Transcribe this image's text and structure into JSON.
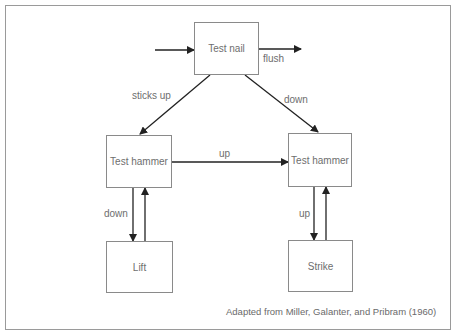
{
  "diagram": {
    "title": "",
    "nodes": [
      {
        "id": "test-nail",
        "label": "Test nail"
      },
      {
        "id": "test-hammer-left",
        "label": "Test hammer"
      },
      {
        "id": "test-hammer-right",
        "label": "Test hammer"
      },
      {
        "id": "lift",
        "label": "Lift"
      },
      {
        "id": "strike",
        "label": "Strike"
      }
    ],
    "edges": [
      {
        "from": "entry",
        "to": "test-nail",
        "label": ""
      },
      {
        "from": "test-nail",
        "to": "exit",
        "label": "flush"
      },
      {
        "from": "test-nail",
        "to": "test-hammer-left",
        "label": "sticks up"
      },
      {
        "from": "test-nail",
        "to": "test-hammer-right",
        "label": "down"
      },
      {
        "from": "test-hammer-left",
        "to": "test-hammer-right",
        "label": "up"
      },
      {
        "from": "test-hammer-left",
        "to": "lift",
        "label": "down"
      },
      {
        "from": "lift",
        "to": "test-hammer-left",
        "label": ""
      },
      {
        "from": "test-hammer-right",
        "to": "strike",
        "label": "up"
      },
      {
        "from": "strike",
        "to": "test-hammer-right",
        "label": ""
      }
    ],
    "caption": "Adapted from Miller, Galanter, and Pribram (1960)"
  },
  "colors": {
    "line": "#222222",
    "box_border": "#8a8a8a",
    "text": "#6e6e6e",
    "frame": "#9a9a9a"
  }
}
